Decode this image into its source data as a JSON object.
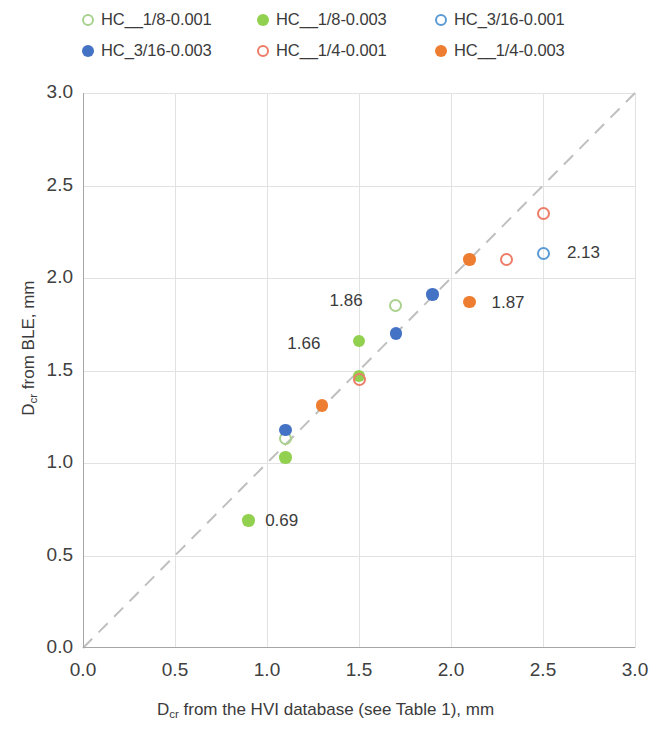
{
  "chart_data": {
    "type": "scatter",
    "title": "",
    "xlabel": "D_cr from the HVI database (see Table 1), mm",
    "ylabel": "D_cr from BLE, mm",
    "xlim": [
      0.0,
      3.0
    ],
    "ylim": [
      0.0,
      3.0
    ],
    "xticks": [
      "0.0",
      "0.5",
      "1.0",
      "1.5",
      "2.0",
      "2.5",
      "3.0"
    ],
    "yticks": [
      "0.0",
      "0.5",
      "1.0",
      "1.5",
      "2.0",
      "2.5",
      "3.0"
    ],
    "grid": true,
    "legend_position": "top",
    "reference_line": {
      "type": "dashed-diagonal",
      "from": [
        0.0,
        0.0
      ],
      "to": [
        3.0,
        3.0
      ],
      "color": "#bfbfbf"
    },
    "series": [
      {
        "name": "HC__1/8-0.001",
        "marker": "open-circle",
        "color": "#a9d18e",
        "points": [
          [
            1.1,
            1.13
          ],
          [
            1.7,
            1.85
          ]
        ]
      },
      {
        "name": "HC__1/8-0.003",
        "marker": "filled-circle",
        "color": "#92d050",
        "points": [
          [
            0.9,
            0.69
          ],
          [
            1.1,
            1.03
          ],
          [
            1.5,
            1.66
          ],
          [
            1.5,
            1.47
          ]
        ]
      },
      {
        "name": "HC_3/16-0.001",
        "marker": "open-circle",
        "color": "#5b9bd5",
        "points": [
          [
            2.5,
            2.13
          ]
        ]
      },
      {
        "name": "HC_3/16-0.003",
        "marker": "filled-circle",
        "color": "#4472c4",
        "points": [
          [
            1.1,
            1.18
          ],
          [
            1.7,
            1.7
          ],
          [
            1.9,
            1.91
          ]
        ]
      },
      {
        "name": "HC__1/4-0.001",
        "marker": "open-circle",
        "color": "#ed7d68",
        "points": [
          [
            1.5,
            1.45
          ],
          [
            2.3,
            2.1
          ],
          [
            2.5,
            2.35
          ]
        ]
      },
      {
        "name": "HC__1/4-0.003",
        "marker": "filled-circle",
        "color": "#ed7d31",
        "points": [
          [
            1.3,
            1.31
          ],
          [
            2.1,
            2.1
          ],
          [
            2.1,
            1.87
          ]
        ]
      }
    ],
    "annotations": [
      {
        "text": "0.69",
        "x": 0.99,
        "y": 0.68
      },
      {
        "text": "1.66",
        "x": 1.29,
        "y": 1.64
      },
      {
        "text": "1.86",
        "x": 1.52,
        "y": 1.87
      },
      {
        "text": "1.87",
        "x": 2.22,
        "y": 1.86
      },
      {
        "text": "2.13",
        "x": 2.63,
        "y": 2.13
      }
    ]
  },
  "legend": {
    "items": [
      {
        "label": "HC__1/8-0.001",
        "marker": "open-circle",
        "color": "#a9d18e"
      },
      {
        "label": "HC__1/8-0.003",
        "marker": "filled-circle",
        "color": "#92d050"
      },
      {
        "label": "HC_3/16-0.001",
        "marker": "open-circle",
        "color": "#5b9bd5"
      },
      {
        "label": "HC_3/16-0.003",
        "marker": "filled-circle",
        "color": "#4472c4"
      },
      {
        "label": "HC__1/4-0.001",
        "marker": "open-circle",
        "color": "#ed7d68"
      },
      {
        "label": "HC__1/4-0.003",
        "marker": "filled-circle",
        "color": "#ed7d31"
      }
    ]
  },
  "axes": {
    "x_title_pre": "D",
    "x_title_sub": "cr",
    "x_title_post": " from the HVI database (see Table 1), mm",
    "y_title_pre": "D",
    "y_title_sub": "cr",
    "y_title_post": " from BLE, mm"
  }
}
